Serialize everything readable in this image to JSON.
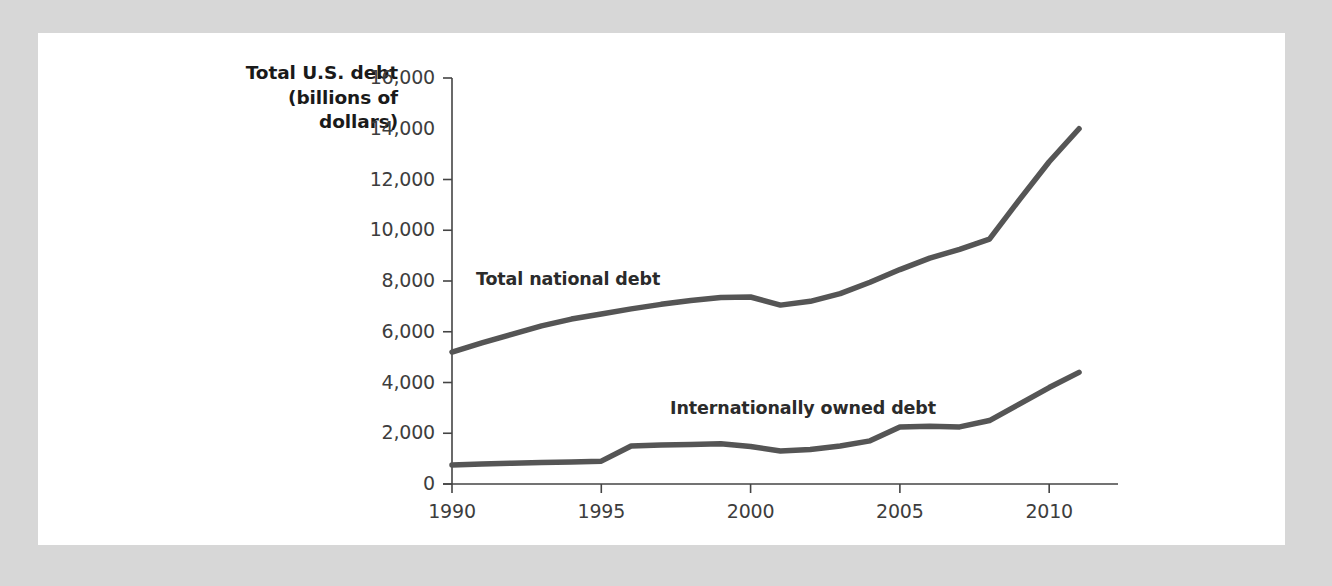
{
  "figure": {
    "background_color": "#d7d7d7",
    "card_color": "#ffffff",
    "line_color": "#555555",
    "axis_color": "#444444",
    "text_color": "#3d3d3d"
  },
  "axis_title_line1": "Total U.S. debt",
  "axis_title_line2": "(billions of",
  "axis_title_line3": "dollars)",
  "y_ticks": [
    {
      "label": "16,000",
      "value": 16000,
      "tick_mark": true
    },
    {
      "label": "14,000",
      "value": 14000,
      "tick_mark": false
    },
    {
      "label": "12,000",
      "value": 12000,
      "tick_mark": true
    },
    {
      "label": "10,000",
      "value": 10000,
      "tick_mark": true
    },
    {
      "label": "8,000",
      "value": 8000,
      "tick_mark": true
    },
    {
      "label": "6,000",
      "value": 6000,
      "tick_mark": true
    },
    {
      "label": "4,000",
      "value": 4000,
      "tick_mark": true
    },
    {
      "label": "2,000",
      "value": 2000,
      "tick_mark": true
    },
    {
      "label": "0",
      "value": 0,
      "tick_mark": true
    }
  ],
  "x_ticks": [
    {
      "label": "1990",
      "value": 1990
    },
    {
      "label": "1995",
      "value": 1995
    },
    {
      "label": "2000",
      "value": 2000
    },
    {
      "label": "2005",
      "value": 2005
    },
    {
      "label": "2010",
      "value": 2010
    }
  ],
  "series_labels": [
    {
      "text": "Total national debt",
      "x": 1990.8,
      "y": 8050
    },
    {
      "text": "Internationally owned debt",
      "x": 1997.3,
      "y": 2950
    }
  ],
  "chart_data": {
    "type": "line",
    "title": "",
    "subtitle": "",
    "xlabel": "",
    "ylabel": "Total U.S. debt (billions of dollars)",
    "xlim": [
      1990,
      2011.3
    ],
    "ylim": [
      0,
      16000
    ],
    "grid": false,
    "legend": "inline-labels",
    "x": [
      1990,
      1991,
      1992,
      1993,
      1994,
      1995,
      1996,
      1997,
      1998,
      1999,
      2000,
      2001,
      2002,
      2003,
      2004,
      2005,
      2006,
      2007,
      2008,
      2009,
      2010,
      2011
    ],
    "series": [
      {
        "name": "Total national debt",
        "color": "#555555",
        "values": [
          5200,
          5560,
          5900,
          6230,
          6500,
          6700,
          6900,
          7080,
          7230,
          7350,
          7370,
          7050,
          7200,
          7500,
          7950,
          8450,
          8900,
          9250,
          9650,
          11200,
          12700,
          14000
        ]
      },
      {
        "name": "Internationally owned debt",
        "color": "#555555",
        "values": [
          750,
          790,
          820,
          850,
          870,
          900,
          1500,
          1540,
          1560,
          1590,
          1480,
          1300,
          1360,
          1500,
          1700,
          2250,
          2280,
          2250,
          2500,
          3150,
          3800,
          4400
        ]
      }
    ]
  }
}
